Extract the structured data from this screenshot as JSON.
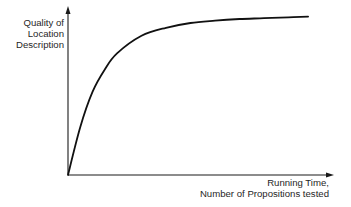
{
  "chart_data": {
    "type": "line",
    "title": "",
    "xlabel": "Running Time, Number of Propositions tested",
    "ylabel": "Quality of Location Description",
    "xlabel_lines": [
      "Running Time,",
      "Number of Propositions tested"
    ],
    "ylabel_lines": [
      "Quality of",
      "Location",
      "Description"
    ],
    "x_ticks": [],
    "y_ticks": [],
    "grid": false,
    "legend": null,
    "xlim": [
      0,
      1
    ],
    "ylim": [
      0,
      1
    ],
    "series": [
      {
        "name": "quality",
        "x": [
          0.0,
          0.05,
          0.1,
          0.15,
          0.2,
          0.3,
          0.4,
          0.5,
          0.6,
          0.7,
          0.8,
          0.9,
          0.98
        ],
        "y": [
          0.0,
          0.3,
          0.52,
          0.66,
          0.76,
          0.87,
          0.92,
          0.95,
          0.965,
          0.975,
          0.98,
          0.985,
          0.99
        ]
      }
    ],
    "annotations": []
  },
  "colors": {
    "axis": "#1a1a1a",
    "curve": "#111111",
    "text": "#1f1f1f",
    "background": "#ffffff"
  }
}
